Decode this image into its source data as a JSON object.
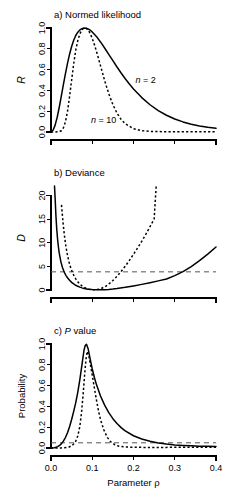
{
  "figure": {
    "width": 243,
    "height": 492,
    "background": "#ffffff",
    "ink_color": "#000000",
    "reference_line_color": "#555555",
    "shared_xlabel": "Parameter ρ"
  },
  "chart_data": [
    {
      "type": "line",
      "panel": "a",
      "title": "a) Normed likelihood",
      "title_parts": [
        {
          "text": "a) Normed likelihood",
          "italic": false
        }
      ],
      "xlabel": "",
      "ylabel": "R",
      "ylabel_italic": true,
      "xlim": [
        0.0,
        0.4
      ],
      "ylim": [
        0.0,
        1.0
      ],
      "xticks": [
        0.0,
        0.1,
        0.2,
        0.3,
        0.4
      ],
      "xticklabels": [
        "",
        "",
        "",
        "",
        ""
      ],
      "yticks": [
        0.0,
        0.2,
        0.4,
        0.6,
        0.8,
        1.0
      ],
      "yticklabels": [
        "0.0",
        "0.2",
        "0.4",
        "0.6",
        "0.8",
        "1.0"
      ],
      "grid": false,
      "legend": "inline-annotations",
      "annotations": [
        {
          "text": "n = 2",
          "italic_prefix": "n",
          "x": 0.205,
          "y": 0.47
        },
        {
          "text": "n = 10",
          "italic_prefix": "n",
          "x": 0.097,
          "y": 0.09
        }
      ],
      "series": [
        {
          "name": "n = 2",
          "style": "solid",
          "x": [
            0.0,
            0.005,
            0.01,
            0.015,
            0.02,
            0.025,
            0.03,
            0.035,
            0.04,
            0.045,
            0.05,
            0.055,
            0.06,
            0.065,
            0.07,
            0.075,
            0.08,
            0.085,
            0.09,
            0.095,
            0.1,
            0.11,
            0.12,
            0.13,
            0.14,
            0.15,
            0.16,
            0.17,
            0.18,
            0.19,
            0.2,
            0.22,
            0.24,
            0.26,
            0.28,
            0.3,
            0.32,
            0.34,
            0.36,
            0.38,
            0.4
          ],
          "y": [
            0.0,
            0.017,
            0.066,
            0.142,
            0.238,
            0.345,
            0.455,
            0.561,
            0.66,
            0.748,
            0.822,
            0.882,
            0.928,
            0.96,
            0.981,
            0.993,
            1.0,
            0.998,
            0.991,
            0.979,
            0.962,
            0.919,
            0.866,
            0.808,
            0.747,
            0.686,
            0.625,
            0.567,
            0.512,
            0.461,
            0.414,
            0.331,
            0.262,
            0.206,
            0.161,
            0.125,
            0.097,
            0.075,
            0.058,
            0.045,
            0.035
          ]
        },
        {
          "name": "n = 10",
          "style": "dashed",
          "x": [
            0.0,
            0.01,
            0.02,
            0.025,
            0.03,
            0.035,
            0.04,
            0.045,
            0.05,
            0.055,
            0.06,
            0.065,
            0.07,
            0.075,
            0.08,
            0.085,
            0.09,
            0.095,
            0.1,
            0.105,
            0.11,
            0.115,
            0.12,
            0.13,
            0.14,
            0.15,
            0.16,
            0.17,
            0.18,
            0.2,
            0.22,
            0.24,
            0.26,
            0.28,
            0.3,
            0.32,
            0.34,
            0.36,
            0.38,
            0.4
          ],
          "y": [
            0.0,
            0.0,
            0.003,
            0.012,
            0.039,
            0.098,
            0.199,
            0.339,
            0.5,
            0.656,
            0.786,
            0.881,
            0.944,
            0.982,
            1.0,
            0.998,
            0.98,
            0.947,
            0.9,
            0.843,
            0.778,
            0.709,
            0.637,
            0.495,
            0.368,
            0.263,
            0.181,
            0.121,
            0.079,
            0.032,
            0.013,
            0.006,
            0.004,
            0.003,
            0.002,
            0.002,
            0.002,
            0.002,
            0.002,
            0.002
          ]
        }
      ]
    },
    {
      "type": "line",
      "panel": "b",
      "title": "b) Deviance",
      "title_parts": [
        {
          "text": "b) Deviance",
          "italic": false
        }
      ],
      "xlabel": "",
      "ylabel": "D",
      "ylabel_italic": true,
      "xlim": [
        0.0,
        0.4
      ],
      "ylim": [
        0.0,
        22.0
      ],
      "xticks": [
        0.0,
        0.1,
        0.2,
        0.3,
        0.4
      ],
      "xticklabels": [
        "",
        "",
        "",
        "",
        ""
      ],
      "yticks": [
        0,
        5,
        10,
        15,
        20
      ],
      "yticklabels": [
        "0",
        "5",
        "10",
        "15",
        "20"
      ],
      "grid": false,
      "reference_lines": [
        {
          "orientation": "horizontal",
          "value": 3.84,
          "style": "dashed",
          "label": ""
        }
      ],
      "series": [
        {
          "name": "n = 2",
          "style": "solid",
          "x": [
            0.0085,
            0.01,
            0.012,
            0.014,
            0.016,
            0.018,
            0.02,
            0.024,
            0.028,
            0.032,
            0.036,
            0.04,
            0.045,
            0.05,
            0.055,
            0.06,
            0.065,
            0.07,
            0.075,
            0.08,
            0.09,
            0.1,
            0.11,
            0.12,
            0.13,
            0.14,
            0.15,
            0.16,
            0.18,
            0.2,
            0.22,
            0.24,
            0.26,
            0.28,
            0.3,
            0.32,
            0.34,
            0.36,
            0.38,
            0.4
          ],
          "y": [
            22.0,
            19.4,
            15.6,
            12.8,
            10.7,
            9.1,
            7.8,
            5.95,
            4.7,
            3.8,
            3.1,
            2.6,
            2.05,
            1.62,
            1.28,
            1.0,
            0.78,
            0.6,
            0.45,
            0.33,
            0.17,
            0.08,
            0.04,
            0.04,
            0.07,
            0.13,
            0.21,
            0.31,
            0.56,
            0.86,
            1.19,
            1.55,
            1.93,
            2.33,
            3.05,
            3.88,
            4.95,
            6.2,
            7.6,
            9.1
          ]
        },
        {
          "name": "n = 10",
          "style": "dashed",
          "x": [
            0.0255,
            0.027,
            0.029,
            0.031,
            0.033,
            0.036,
            0.039,
            0.042,
            0.045,
            0.048,
            0.052,
            0.056,
            0.06,
            0.065,
            0.07,
            0.075,
            0.08,
            0.085,
            0.09,
            0.095,
            0.1,
            0.11,
            0.12,
            0.13,
            0.14,
            0.15,
            0.16,
            0.17,
            0.18,
            0.19,
            0.2,
            0.21,
            0.22,
            0.23,
            0.24,
            0.25,
            0.255
          ],
          "y": [
            18.0,
            16.4,
            14.4,
            12.7,
            11.2,
            9.3,
            7.8,
            6.55,
            5.5,
            4.65,
            3.7,
            2.95,
            2.35,
            1.72,
            1.24,
            0.87,
            0.58,
            0.38,
            0.23,
            0.13,
            0.07,
            0.06,
            0.25,
            0.65,
            1.25,
            2.0,
            2.9,
            3.92,
            5.05,
            6.25,
            7.55,
            8.9,
            10.3,
            11.8,
            13.4,
            15.0,
            22.0
          ]
        }
      ]
    },
    {
      "type": "line",
      "panel": "c",
      "title": "c) P value",
      "title_parts": [
        {
          "text": "c) ",
          "italic": false
        },
        {
          "text": "P",
          "italic": true
        },
        {
          "text": " value",
          "italic": false
        }
      ],
      "xlabel": "Parameter ρ",
      "ylabel": "Probability",
      "ylabel_italic": false,
      "xlim": [
        0.0,
        0.4
      ],
      "ylim": [
        0.0,
        1.0
      ],
      "xticks": [
        0.0,
        0.1,
        0.2,
        0.3,
        0.4
      ],
      "xticklabels": [
        "0.0",
        "0.1",
        "0.2",
        "0.3",
        "0.4"
      ],
      "yticks": [
        0.0,
        0.2,
        0.4,
        0.6,
        0.8,
        1.0
      ],
      "yticklabels": [
        "0.0",
        "0.2",
        "0.4",
        "0.6",
        "0.8",
        "1.0"
      ],
      "grid": false,
      "reference_lines": [
        {
          "orientation": "horizontal",
          "value": 0.05,
          "style": "dashed",
          "label": ""
        }
      ],
      "series": [
        {
          "name": "n = 2",
          "style": "solid",
          "x": [
            0.0,
            0.008,
            0.012,
            0.016,
            0.02,
            0.025,
            0.03,
            0.035,
            0.04,
            0.045,
            0.05,
            0.055,
            0.06,
            0.065,
            0.07,
            0.075,
            0.08,
            0.083,
            0.086,
            0.09,
            0.095,
            0.1,
            0.105,
            0.11,
            0.12,
            0.13,
            0.14,
            0.15,
            0.16,
            0.17,
            0.18,
            0.2,
            0.22,
            0.24,
            0.26,
            0.28,
            0.3,
            0.32,
            0.34,
            0.36,
            0.38,
            0.4
          ],
          "y": [
            0.0,
            0.003,
            0.007,
            0.013,
            0.022,
            0.04,
            0.066,
            0.101,
            0.147,
            0.205,
            0.274,
            0.352,
            0.437,
            0.538,
            0.66,
            0.8,
            0.94,
            0.985,
            0.998,
            0.955,
            0.855,
            0.76,
            0.68,
            0.612,
            0.5,
            0.412,
            0.34,
            0.282,
            0.235,
            0.196,
            0.165,
            0.118,
            0.086,
            0.064,
            0.048,
            0.038,
            0.03,
            0.025,
            0.021,
            0.018,
            0.016,
            0.015
          ]
        },
        {
          "name": "n = 10",
          "style": "dashed",
          "x": [
            0.0,
            0.015,
            0.025,
            0.032,
            0.038,
            0.044,
            0.05,
            0.055,
            0.06,
            0.065,
            0.07,
            0.074,
            0.078,
            0.082,
            0.085,
            0.088,
            0.092,
            0.096,
            0.1,
            0.105,
            0.11,
            0.115,
            0.12,
            0.128,
            0.136,
            0.145,
            0.155,
            0.165,
            0.18,
            0.2,
            0.22,
            0.24,
            0.26,
            0.28,
            0.3,
            0.32,
            0.34,
            0.36,
            0.38,
            0.4
          ],
          "y": [
            0.0,
            0.0,
            0.001,
            0.002,
            0.005,
            0.01,
            0.021,
            0.038,
            0.066,
            0.115,
            0.21,
            0.34,
            0.52,
            0.73,
            0.86,
            0.93,
            0.88,
            0.79,
            0.7,
            0.58,
            0.465,
            0.36,
            0.272,
            0.175,
            0.105,
            0.058,
            0.03,
            0.017,
            0.01,
            0.007,
            0.006,
            0.006,
            0.006,
            0.006,
            0.007,
            0.007,
            0.008,
            0.008,
            0.008,
            0.008
          ]
        }
      ]
    }
  ]
}
